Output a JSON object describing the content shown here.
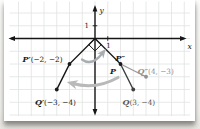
{
  "page": {
    "background": "#f4f3f0",
    "card_background": "#ffffff"
  },
  "diagram": {
    "type": "coordinate-plane-rotation",
    "origin_px": [
      91,
      38.5
    ],
    "unit_px": 12.75,
    "grid_color": "#e0e3e1",
    "axes": {
      "x_label": "x",
      "y_label": "y",
      "x_tick_label": "1",
      "y_tick_label": "1",
      "color": "#161616"
    },
    "points": [
      {
        "id": "P",
        "letter": "P",
        "coords_text": "",
        "x": 2,
        "y": -2,
        "color": "#1a1a1a",
        "dot": true,
        "dot_color": "#1a1a1a",
        "anchor": "start",
        "label_px": [
          106,
          73.5
        ]
      },
      {
        "id": "P-prime",
        "letter": "P′",
        "coords_text": "(−2, −2)",
        "x": -2,
        "y": -2,
        "color": "#1a1a1a",
        "dot": true,
        "dot_color": "#1a1a1a",
        "anchor": "end",
        "label_px": [
          58.5,
          62
        ]
      },
      {
        "id": "P-double-prime",
        "letter": "P″",
        "coords_text": "",
        "x": 2,
        "y": -2,
        "color": "#1a1a1a",
        "dot": false,
        "dot_color": "#1a1a1a",
        "anchor": "start",
        "label_px": [
          111.5,
          61
        ]
      },
      {
        "id": "Q",
        "letter": "Q",
        "coords_text": "(3, −4)",
        "x": 3,
        "y": -4,
        "color": "#585858",
        "dot": true,
        "dot_color": "#3f3f3f",
        "anchor": "start",
        "label_px": [
          118.5,
          105
        ]
      },
      {
        "id": "Q-prime",
        "letter": "Q′",
        "coords_text": "(−3, −4)",
        "x": -3,
        "y": -4,
        "color": "#1a1a1a",
        "dot": true,
        "dot_color": "#1a1a1a",
        "anchor": "middle",
        "label_px": [
          51.5,
          105
        ]
      },
      {
        "id": "Q-double-prime",
        "letter": "Q″",
        "coords_text": "(4, −3)",
        "x": 4,
        "y": -3,
        "color": "#919191",
        "dot": true,
        "dot_color": "#919191",
        "anchor": "start",
        "label_px": [
          133.5,
          73.5
        ]
      }
    ],
    "segments": [
      {
        "from": "origin",
        "to": "P-prime",
        "color": "#161616",
        "width": 1.2
      },
      {
        "from": "origin",
        "to": "P",
        "color": "#161616",
        "width": 1.2
      },
      {
        "from": "P-prime",
        "to": "Q-prime",
        "color": "#161616",
        "width": 1.5
      },
      {
        "from": "P",
        "to": "Q",
        "color": "#3d3d3d",
        "width": 1.4
      },
      {
        "from": "P",
        "to": "Q-double-prime",
        "color": "#9a9a9a",
        "width": 1.3
      }
    ],
    "right_angle_marker": {
      "at": "origin",
      "size_px": 6.2,
      "color": "#161616"
    },
    "rotation_arrows": [
      {
        "id": "small-arrow",
        "path": "M 78,59.5 Q 88,67 99,52.5",
        "color": "#a7adb0",
        "width": 2.3,
        "marker": "head-small"
      },
      {
        "id": "large-arrow",
        "path": "M 114,77.5 Q 92,90 68.5,83.5",
        "color": "#b9b9b9",
        "width": 3.1,
        "marker": "head-large"
      }
    ]
  }
}
